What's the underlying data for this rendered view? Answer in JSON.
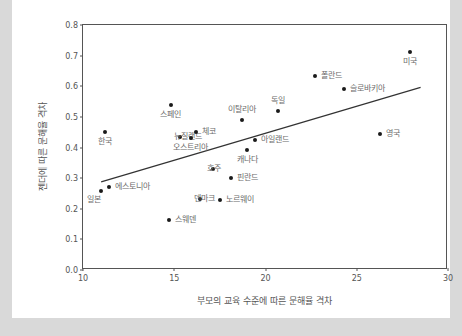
{
  "chart_data": {
    "type": "scatter",
    "title": "",
    "xlabel": "부모의 교육 수준에 따른 문해율 격차",
    "ylabel": "젠더에 따른 문해율 격차",
    "xlim": [
      10,
      30
    ],
    "ylim": [
      0.0,
      0.8
    ],
    "xticks": [
      "10",
      "15",
      "20",
      "25",
      "30"
    ],
    "yticks": [
      "0.0",
      "0.1",
      "0.2",
      "0.3",
      "0.4",
      "0.5",
      "0.6",
      "0.7",
      "0.8"
    ],
    "grid": false,
    "legend": "none",
    "point_color": "#1a1a1a",
    "label_color": "#6b6b6b",
    "axis_color": "#555555",
    "background": "#ffffff",
    "page_background": "#d9d9d9",
    "trendline": {
      "visible": true,
      "x_start": 11.0,
      "y_start": 0.285,
      "x_end": 28.6,
      "y_end": 0.595,
      "color": "#333333"
    },
    "points": [
      {
        "label": "일본",
        "x": 11.0,
        "y": 0.258,
        "pos": "bl"
      },
      {
        "label": "에스토니아",
        "x": 11.4,
        "y": 0.272,
        "pos": "right"
      },
      {
        "label": "한국",
        "x": 11.2,
        "y": 0.451,
        "pos": "below"
      },
      {
        "label": "스웨덴",
        "x": 14.7,
        "y": 0.163,
        "pos": "right"
      },
      {
        "label": "스페인",
        "x": 14.8,
        "y": 0.54,
        "pos": "below"
      },
      {
        "label": "뉴질랜드",
        "x": 15.3,
        "y": 0.433,
        "pos": "left"
      },
      {
        "label": "오스트리아",
        "x": 15.9,
        "y": 0.43,
        "pos": "below"
      },
      {
        "label": "체코",
        "x": 16.2,
        "y": 0.45,
        "pos": "right"
      },
      {
        "label": "덴마크",
        "x": 16.4,
        "y": 0.233,
        "pos": "left"
      },
      {
        "label": "호주",
        "x": 17.1,
        "y": 0.33,
        "pos": "left"
      },
      {
        "label": "노르웨이",
        "x": 17.5,
        "y": 0.23,
        "pos": "right"
      },
      {
        "label": "핀란드",
        "x": 18.1,
        "y": 0.302,
        "pos": "right"
      },
      {
        "label": "이탈리아",
        "x": 18.7,
        "y": 0.49,
        "pos": "above"
      },
      {
        "label": "캐나다",
        "x": 19.0,
        "y": 0.392,
        "pos": "below"
      },
      {
        "label": "아일랜드",
        "x": 19.4,
        "y": 0.425,
        "pos": "right"
      },
      {
        "label": "독일",
        "x": 20.7,
        "y": 0.52,
        "pos": "above"
      },
      {
        "label": "폴란드",
        "x": 22.7,
        "y": 0.632,
        "pos": "right"
      },
      {
        "label": "슬로바키아",
        "x": 24.3,
        "y": 0.592,
        "pos": "right"
      },
      {
        "label": "영국",
        "x": 26.3,
        "y": 0.443,
        "pos": "right"
      },
      {
        "label": "미국",
        "x": 27.9,
        "y": 0.712,
        "pos": "below"
      }
    ]
  }
}
